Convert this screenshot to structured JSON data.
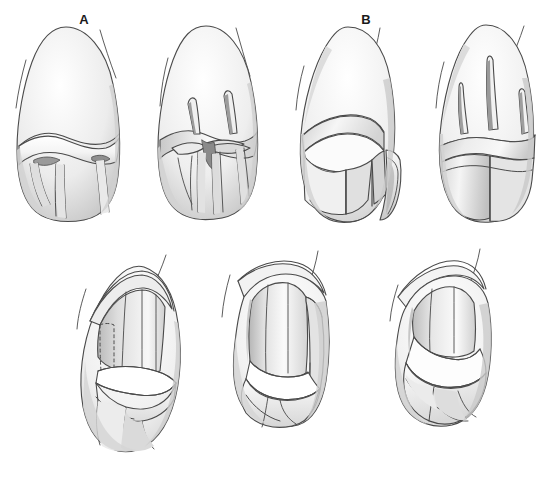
{
  "figure": {
    "background_color": "#ffffff",
    "ink_color": "#3a3a3a",
    "shade_light": "#f2f2f2",
    "shade_mid": "#d9d9d9",
    "shade_dark": "#b8b8b8",
    "width": 560,
    "height": 482,
    "panel_count": 7,
    "label_row_top": [
      "A",
      "B",
      "C",
      "D"
    ],
    "label_row_bottom": [
      "E",
      "F",
      "G"
    ]
  },
  "panels": [
    {
      "id": "a",
      "label": "A",
      "row": "top",
      "caption": "Intact crown, facial view with gingival margin and root outline",
      "label_x": 78,
      "label_y": 13
    },
    {
      "id": "b",
      "label": "B",
      "row": "top",
      "caption": "Depth orientation grooves cut in incisal and middle thirds",
      "label_x": 212,
      "label_y": 13
    },
    {
      "id": "c",
      "label": "C",
      "row": "top",
      "caption": "Incisal and facial reduction in progress, angled view",
      "label_x": 345,
      "label_y": 13
    },
    {
      "id": "d",
      "label": "D",
      "row": "top",
      "caption": "Completed incisal reduction with remaining depth grooves",
      "label_x": 482,
      "label_y": 13
    },
    {
      "id": "e",
      "label": "E",
      "row": "bottom",
      "caption": "Proximal reduction with dashed outline of removed tooth structure",
      "label_x": 129,
      "label_y": 459
    },
    {
      "id": "f",
      "label": "F",
      "row": "bottom",
      "caption": "Axial reduction completed, chamfer finish line established",
      "label_x": 289,
      "label_y": 459
    },
    {
      "id": "g",
      "label": "G",
      "row": "bottom",
      "caption": "Finished preparation, rounded line angles, lingual aspect",
      "label_x": 441,
      "label_y": 459
    }
  ]
}
